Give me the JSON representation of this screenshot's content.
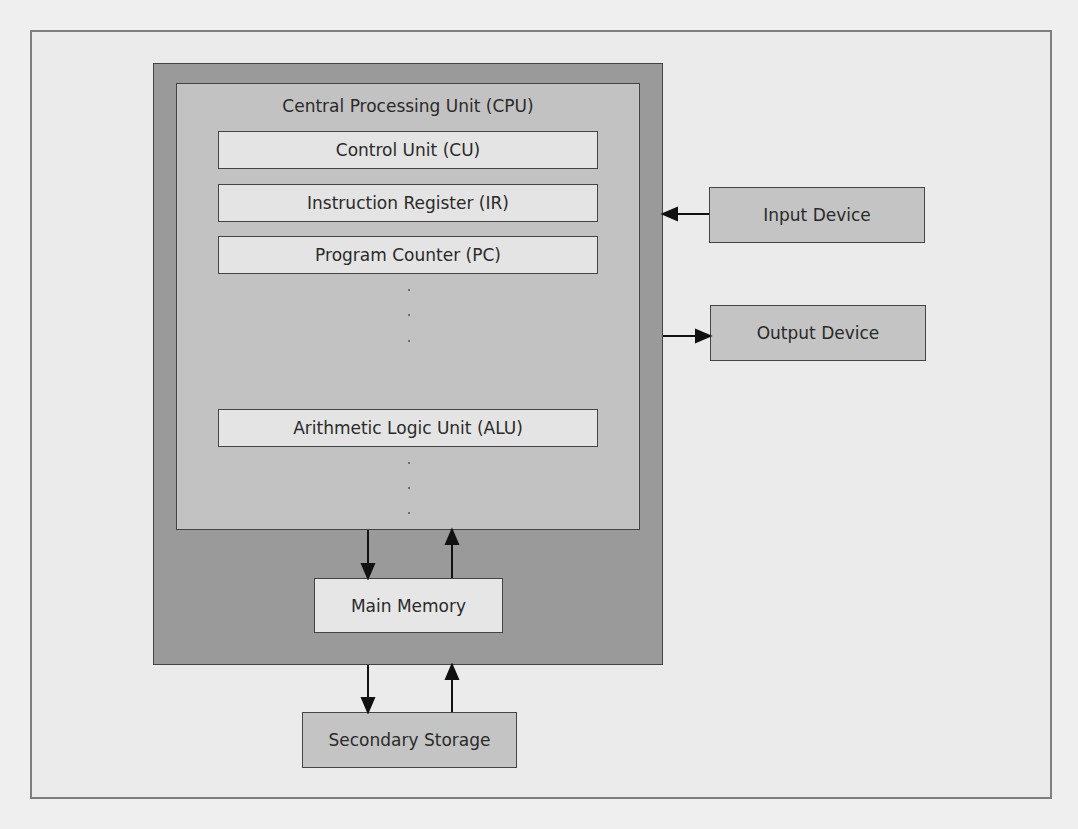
{
  "diagram": {
    "cpu": {
      "title": "Central Processing Unit (CPU)",
      "registers": [
        {
          "id": "cu",
          "label": "Control Unit (CU)"
        },
        {
          "id": "ir",
          "label": "Instruction Register (IR)"
        },
        {
          "id": "pc",
          "label": "Program Counter (PC)"
        },
        {
          "id": "alu",
          "label": "Arithmetic Logic Unit (ALU)"
        }
      ],
      "ellipsis_groups": 2
    },
    "main_memory": {
      "label": "Main Memory"
    },
    "secondary_storage": {
      "label": "Secondary Storage"
    },
    "input_device": {
      "label": "Input Device"
    },
    "output_device": {
      "label": "Output Device"
    },
    "connections": [
      {
        "from": "Input Device",
        "to": "Computer",
        "direction": "left"
      },
      {
        "from": "Computer",
        "to": "Output Device",
        "direction": "right"
      },
      {
        "from": "CPU",
        "to": "Main Memory",
        "direction": "down"
      },
      {
        "from": "Main Memory",
        "to": "CPU",
        "direction": "up"
      },
      {
        "from": "Main Memory",
        "to": "Secondary Storage",
        "direction": "down"
      },
      {
        "from": "Secondary Storage",
        "to": "Main Memory",
        "direction": "up"
      }
    ],
    "colors": {
      "background": "#efefef",
      "computer_box": "#9a9a9a",
      "cpu_box": "#c2c2c2",
      "register_box": "#e4e4e4",
      "device_box": "#c4c4c4",
      "border": "#444444"
    }
  }
}
